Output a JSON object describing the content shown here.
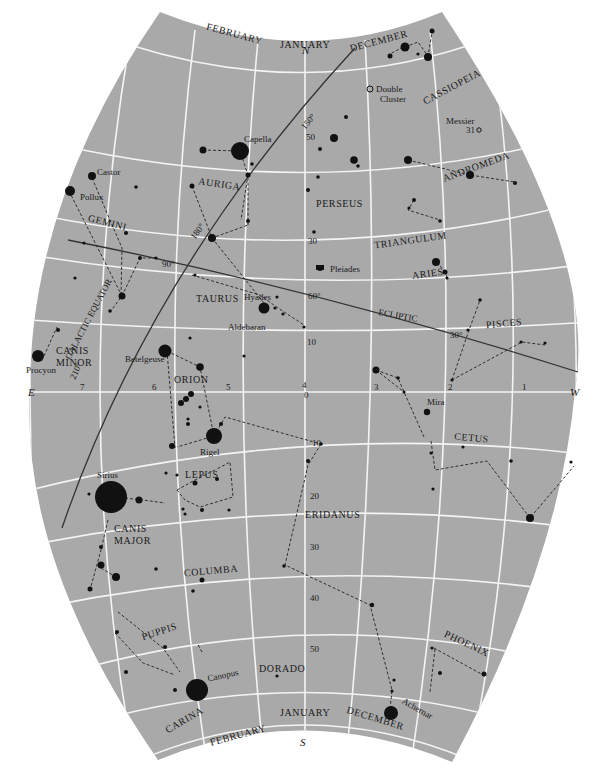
{
  "directions": {
    "north": "N",
    "south": "S",
    "east": "E",
    "west": "W"
  },
  "months_top": [
    "FEBRUARY",
    "JANUARY",
    "DECEMBER"
  ],
  "months_bottom": [
    "FEBRUARY",
    "JANUARY",
    "DECEMBER"
  ],
  "ra_hours": [
    "7",
    "6",
    "5",
    "4",
    "3",
    "2",
    "1"
  ],
  "declinations": [
    "60",
    "50",
    "30",
    "10",
    "0",
    "-10",
    "-20",
    "-30",
    "-40",
    "-50"
  ],
  "dec_labels": {
    "d50": "50",
    "d30": "30",
    "d10": "10",
    "d0": "0",
    "dm10": "10",
    "dm20": "20",
    "dm30": "30",
    "dm40": "40",
    "dm50": "50"
  },
  "lines": {
    "ecliptic": "ECLIPTIC",
    "galactic_equator": "GALACTIC EQUATOR",
    "galactic_ticks": [
      "150°",
      "180°",
      "90°",
      "210°"
    ],
    "ecliptic_ticks": [
      "60°",
      "30°"
    ]
  },
  "constellations": {
    "cassiopeia": "CASSIOPEIA",
    "andromeda": "ANDROMEDA",
    "perseus": "PERSEUS",
    "triangulum": "TRIANGULUM",
    "aries": "ARIES",
    "auriga": "AURIGA",
    "gemini": "GEMINI",
    "taurus": "TAURUS",
    "canis_minor_1": "CANIS",
    "canis_minor_2": "MINOR",
    "orion": "ORION",
    "pisces": "PISCES",
    "cetus": "CETUS",
    "lepus": "LEPUS",
    "eridanus": "ERIDANUS",
    "canis_major_1": "CANIS",
    "canis_major_2": "MAJOR",
    "columba": "COLUMBA",
    "puppis": "PUPPIS",
    "dorado": "DORADO",
    "carina": "CARINA",
    "phoenix": "PHOENIX"
  },
  "named_objects": {
    "double_cluster_1": "Double",
    "double_cluster_2": "Cluster",
    "messier_1": "Messier",
    "messier_2": "31",
    "capella": "Capella",
    "castor": "Castor",
    "pollux": "Pollux",
    "pleiades": "Pleiades",
    "hyades": "Hyades",
    "aldebaran": "Aldebaran",
    "procyon": "Procyon",
    "betelgeuse": "Betelgeuse",
    "rigel": "Rigel",
    "mira": "Mira",
    "sirius": "Sirius",
    "canopus": "Canopus",
    "achernar": "Achernar"
  },
  "colors": {
    "sky": "#a9a9a9",
    "grid": "#f4f4f4",
    "stars": "#111111",
    "background": "#ffffff"
  }
}
